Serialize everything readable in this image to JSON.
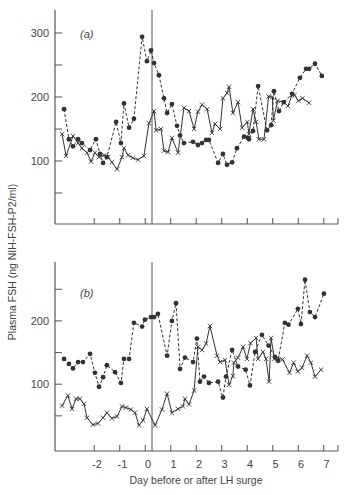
{
  "figure": {
    "ylabel": "Plasma FSH (ng NIH-FSH-P2/ml)",
    "xlabel": "Day before or after LH surge",
    "x_tick_labels": [
      "-2",
      "-1",
      "0",
      "1",
      "2",
      "3",
      "4",
      "5",
      "6",
      "7"
    ]
  },
  "colors": {
    "ink": "#333333",
    "axis": "#555555",
    "background": "#ffffff"
  },
  "chart_data": [
    {
      "type": "line",
      "panel": "(a)",
      "title": "(a)",
      "xlabel": "Day before or after LH surge",
      "ylabel": "Plasma FSH (ng NIH-FSH-P2/ml)",
      "xlim": [
        -3.75,
        7.5
      ],
      "ylim": [
        0,
        330
      ],
      "y_ticks_labeled": [
        100,
        200,
        300
      ],
      "y_ticks_minor": [
        50,
        150,
        250
      ],
      "x_ticks": [
        -2,
        -1,
        0,
        1,
        2,
        3,
        4,
        5,
        6,
        7
      ],
      "vline_at": 0,
      "grid": false,
      "series": [
        {
          "name": "dots (dashed)",
          "marker": "filled-circle",
          "linestyle": "dashed",
          "x": [
            -3.37,
            -3.18,
            -3.02,
            -2.82,
            -2.67,
            -2.35,
            -2.12,
            -1.96,
            -1.84,
            -1.69,
            -1.33,
            -1.14,
            -1.02,
            -0.82,
            -0.63,
            -0.31,
            -0.12,
            0.04,
            0.16,
            0.35,
            0.55,
            0.67,
            0.86,
            1.06,
            1.18,
            1.33,
            1.69,
            1.88,
            2.04,
            2.2,
            2.31,
            2.67,
            2.86,
            3.02,
            3.22,
            3.41,
            3.69,
            3.84,
            3.88,
            4.04,
            4.24,
            4.59,
            4.75,
            4.86,
            5.06,
            5.25,
            5.57,
            5.88,
            6.12,
            6.24,
            6.47,
            6.74
          ],
          "values": [
            181,
            134,
            123,
            134,
            128,
            117,
            134,
            111,
            97,
            106,
            161,
            128,
            190,
            152,
            166,
            294,
            256,
            273,
            253,
            234,
            198,
            175,
            189,
            155,
            140,
            128,
            130,
            125,
            128,
            133,
            133,
            97,
            111,
            94,
            98,
            120,
            138,
            136,
            134,
            147,
            217,
            148,
            156,
            209,
            178,
            192,
            205,
            230,
            244,
            244,
            252,
            233,
            245
          ]
        },
        {
          "name": "crosses (solid)",
          "marker": "x",
          "linestyle": "solid",
          "x": [
            -3.45,
            -3.29,
            -3.02,
            -2.82,
            -2.67,
            -2.47,
            -2.31,
            -2.16,
            -2.0,
            -1.8,
            -1.65,
            -1.49,
            -1.29,
            -1.1,
            -1.02,
            -0.86,
            -0.67,
            -0.47,
            -0.24,
            -0.04,
            0.16,
            0.24,
            0.43,
            0.55,
            0.71,
            0.86,
            1.1,
            1.33,
            1.53,
            1.73,
            1.88,
            2.04,
            2.24,
            2.43,
            2.55,
            2.75,
            2.86,
            3.02,
            3.1,
            3.25,
            3.45,
            3.61,
            3.82,
            3.88,
            4.04,
            4.16,
            4.27,
            4.47,
            4.65,
            4.8,
            4.84,
            5.0,
            5.24,
            5.41,
            5.57,
            5.67,
            5.82,
            5.98,
            6.24
          ],
          "values": [
            142,
            108,
            139,
            128,
            120,
            113,
            99,
            113,
            106,
            109,
            106,
            98,
            87,
            106,
            120,
            109,
            105,
            102,
            108,
            159,
            178,
            148,
            150,
            116,
            114,
            136,
            113,
            183,
            178,
            150,
            177,
            188,
            181,
            144,
            158,
            150,
            198,
            206,
            216,
            175,
            192,
            152,
            161,
            142,
            181,
            161,
            134,
            134,
            201,
            200,
            163,
            194,
            192,
            186,
            203,
            203,
            194,
            198,
            191
          ]
        }
      ]
    },
    {
      "type": "line",
      "panel": "(b)",
      "title": "(b)",
      "xlabel": "Day before or after LH surge",
      "ylabel": "Plasma FSH (ng NIH-FSH-P2/ml)",
      "xlim": [
        -3.75,
        7.5
      ],
      "ylim": [
        0,
        290
      ],
      "y_ticks_labeled": [
        100,
        200
      ],
      "y_ticks_minor": [
        50,
        150,
        250
      ],
      "x_ticks": [
        -2,
        -1,
        0,
        1,
        2,
        3,
        4,
        5,
        6,
        7
      ],
      "vline_at": 0,
      "grid": false,
      "series": [
        {
          "name": "dots (dashed)",
          "marker": "filled-circle",
          "linestyle": "dashed",
          "x": [
            -3.37,
            -3.18,
            -3.02,
            -2.82,
            -2.63,
            -2.35,
            -2.16,
            -2.0,
            -1.84,
            -1.69,
            -1.37,
            -1.14,
            -1.02,
            -0.82,
            -0.63,
            -0.31,
            -0.2,
            0.04,
            0.16,
            0.31,
            0.67,
            0.86,
            1.02,
            1.18,
            1.37,
            1.69,
            1.84,
            1.96,
            2.12,
            2.31,
            2.67,
            2.86,
            2.98,
            3.22,
            3.45,
            3.75,
            3.92,
            4.12,
            4.39,
            4.65,
            4.9,
            5.02,
            5.29,
            5.43,
            5.8,
            5.92,
            6.08,
            6.27,
            6.47,
            6.82
          ],
          "values": [
            140,
            132,
            125,
            135,
            135,
            148,
            118,
            96,
            111,
            130,
            119,
            102,
            140,
            140,
            197,
            191,
            202,
            206,
            206,
            211,
            145,
            200,
            228,
            124,
            142,
            135,
            172,
            104,
            112,
            102,
            104,
            79,
            112,
            154,
            128,
            123,
            98,
            151,
            178,
            161,
            143,
            137,
            197,
            194,
            219,
            195,
            265,
            214,
            206,
            243,
            225
          ]
        },
        {
          "name": "crosses (solid)",
          "marker": "x",
          "linestyle": "solid",
          "x": [
            -3.45,
            -3.22,
            -3.06,
            -2.9,
            -2.75,
            -2.59,
            -2.47,
            -2.24,
            -2.04,
            -1.84,
            -1.69,
            -1.49,
            -1.29,
            -1.1,
            -0.94,
            -0.75,
            -0.59,
            -0.43,
            -0.27,
            -0.12,
            0.2,
            0.47,
            0.67,
            0.86,
            1.1,
            1.29,
            1.37,
            1.53,
            1.73,
            1.88,
            2.04,
            2.2,
            2.35,
            2.63,
            2.75,
            2.94,
            3.1,
            3.25,
            3.29,
            3.45,
            3.65,
            3.8,
            3.94,
            4.16,
            4.24,
            4.43,
            4.55,
            4.67,
            4.75,
            4.88,
            5.0,
            5.2,
            5.47,
            5.63,
            5.8,
            5.96,
            6.16,
            6.31,
            6.47,
            6.71
          ],
          "values": [
            66,
            82,
            61,
            77,
            77,
            69,
            47,
            36,
            38,
            47,
            55,
            46,
            49,
            65,
            63,
            60,
            55,
            35,
            43,
            61,
            35,
            60,
            85,
            55,
            61,
            65,
            77,
            68,
            90,
            159,
            154,
            164,
            192,
            145,
            135,
            138,
            99,
            113,
            134,
            142,
            159,
            140,
            165,
            173,
            140,
            151,
            140,
            104,
            173,
            140,
            142,
            139,
            118,
            134,
            120,
            126,
            145,
            134,
            112,
            123,
            112,
            110,
            106
          ]
        }
      ]
    }
  ]
}
